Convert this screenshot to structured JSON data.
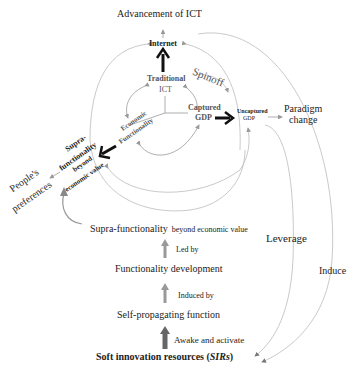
{
  "nodes": {
    "advancement_ict": "Advancement of ICT",
    "internet": "Internet",
    "traditional_ict_l1": "Traditional",
    "traditional_ict_l2": "ICT",
    "spinoff": "Spinoff",
    "captured_gdp_l1": "Captured",
    "captured_gdp_l2": "GDP",
    "uncaptured_gdp_l1": "Uncaptured",
    "uncaptured_gdp_l2": "GDP",
    "paradigm_change_l1": "Paradigm",
    "paradigm_change_l2": "change",
    "economic_functionality_l1": "Economic",
    "economic_functionality_l2": "Functionality",
    "supra_inner_l1": "Supra-",
    "supra_inner_l2": "functionality",
    "supra_inner_l3": "beyond",
    "supra_inner_l4": "economic value",
    "peoples_preferences_l1": "People's",
    "peoples_preferences_l2": "preferences",
    "supra_main": "Supra-functionality",
    "supra_main_suffix": "beyond economic value",
    "led_by": "Led by",
    "functionality_development": "Functionality development",
    "induced_by": "Induced by",
    "self_propagating": "Self-propagating function",
    "awake_activate": "Awake and activate",
    "sirs_prefix": "Soft innovation resources (",
    "sirs_abbr": "SIRs",
    "sirs_suffix": ")",
    "leverage": "Leverage",
    "induce": "Induce"
  },
  "colors": {
    "line": "#aaaaaa",
    "bold_arrow": "#111111",
    "gray_arrow": "#888888",
    "text": "#222222"
  }
}
